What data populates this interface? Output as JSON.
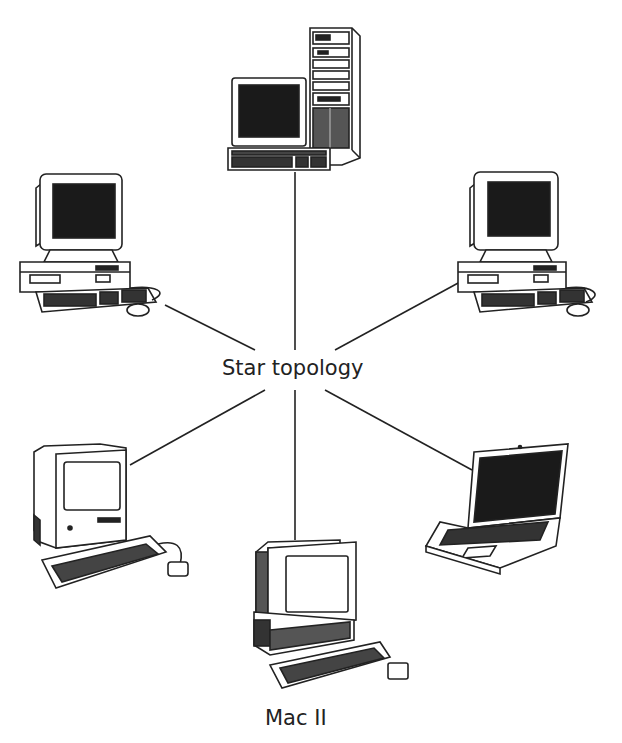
{
  "diagram": {
    "title": "Star topology",
    "hub_label": "Star topology",
    "colors": {
      "background": "#ffffff",
      "ink": "#222222",
      "screen": "#1a1a1a"
    },
    "nodes": [
      {
        "id": "top",
        "type": "tower-workstation",
        "label": ""
      },
      {
        "id": "upper-left",
        "type": "desktop-pc",
        "label": ""
      },
      {
        "id": "upper-right",
        "type": "desktop-pc",
        "label": ""
      },
      {
        "id": "lower-left",
        "type": "compact-macintosh",
        "label": ""
      },
      {
        "id": "lower-right",
        "type": "laptop",
        "label": ""
      },
      {
        "id": "bottom",
        "type": "mac-ii",
        "label": "Mac II"
      }
    ],
    "connections": [
      {
        "from": "hub",
        "to": "top"
      },
      {
        "from": "hub",
        "to": "upper-left"
      },
      {
        "from": "hub",
        "to": "upper-right"
      },
      {
        "from": "hub",
        "to": "lower-left"
      },
      {
        "from": "hub",
        "to": "lower-right"
      },
      {
        "from": "hub",
        "to": "bottom"
      }
    ]
  }
}
